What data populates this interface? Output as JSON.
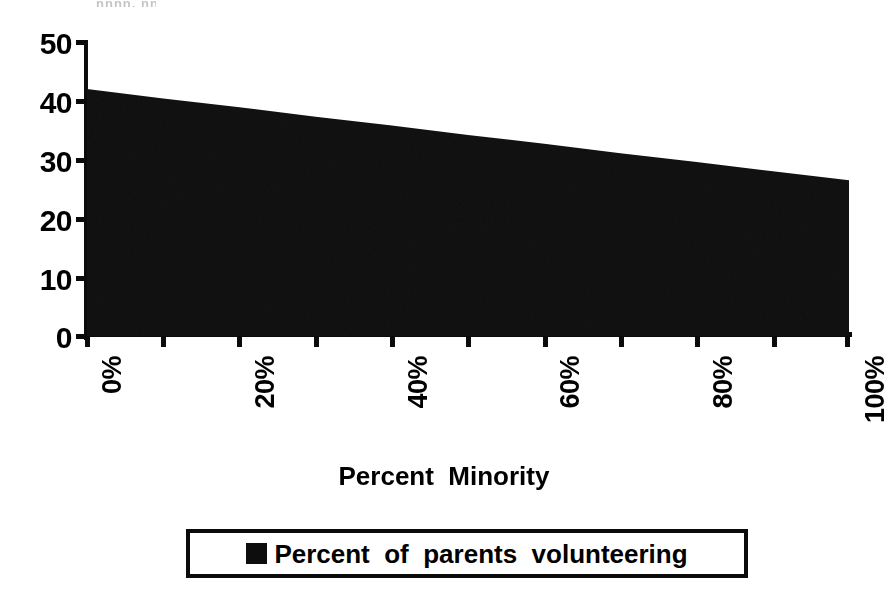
{
  "figure": {
    "top_artifact_text": "nnnn, nnnn",
    "background_color": "#ffffff",
    "ink_color": "#000000"
  },
  "axes": {
    "y": {
      "ticks": [
        "0",
        "10",
        "20",
        "30",
        "40",
        "50"
      ],
      "min": 0,
      "max": 50,
      "step": 10
    },
    "x": {
      "title": "Percent  Minority",
      "labels": [
        "0%",
        "20%",
        "40%",
        "60%",
        "80%",
        "100%"
      ],
      "minor_tick_count": 11
    }
  },
  "legend": {
    "label": "Percent  of  parents  volunteering",
    "swatch_color": "#0d0d0d",
    "border_color": "#0b0b0b"
  },
  "chart_data": {
    "type": "area",
    "title": "",
    "subtitle": "",
    "xlabel": "Percent  Minority",
    "ylabel": "",
    "xlim": [
      0,
      100
    ],
    "ylim": [
      0,
      50
    ],
    "grid": false,
    "legend_position": "bottom",
    "x_tick_labels": [
      "0%",
      "20%",
      "40%",
      "60%",
      "80%",
      "100%"
    ],
    "x_tick_values": [
      0,
      20,
      40,
      60,
      80,
      100
    ],
    "y_tick_values": [
      0,
      10,
      20,
      30,
      40,
      50
    ],
    "series": [
      {
        "name": "Percent  of  parents  volunteering",
        "color": "#0d0d0d",
        "x": [
          0,
          10,
          20,
          30,
          40,
          50,
          60,
          70,
          80,
          90,
          100
        ],
        "values": [
          42.0,
          40.4,
          38.9,
          37.3,
          35.8,
          34.2,
          32.7,
          31.1,
          29.6,
          28.0,
          26.5
        ]
      }
    ],
    "annotations": []
  }
}
